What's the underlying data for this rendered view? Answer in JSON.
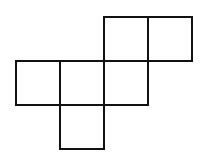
{
  "diagram": {
    "type": "cube-net",
    "stroke_color": "#111111",
    "background": "#ffffff",
    "stroke_width": 2,
    "cell_size": 44,
    "origin": {
      "x": 16,
      "y": 17
    },
    "squares": [
      {
        "col": 2,
        "row": 0
      },
      {
        "col": 3,
        "row": 0
      },
      {
        "col": 0,
        "row": 1
      },
      {
        "col": 1,
        "row": 1
      },
      {
        "col": 2,
        "row": 1
      },
      {
        "col": 1,
        "row": 2
      }
    ]
  }
}
